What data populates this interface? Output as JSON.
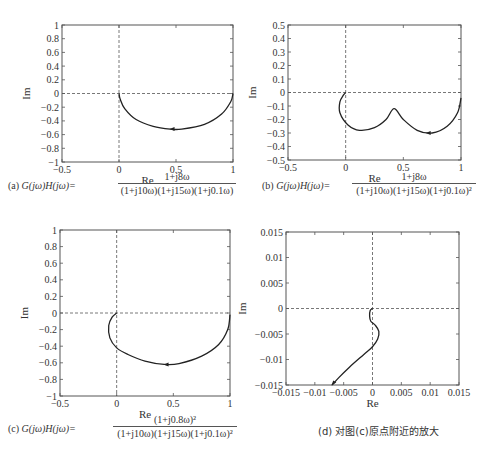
{
  "chart_data": [
    {
      "type": "line",
      "id": "a",
      "title": "",
      "xlabel": "Re",
      "ylabel": "Im",
      "xlim": [
        -0.5,
        1
      ],
      "ylim": [
        -1,
        1
      ],
      "xticks": [
        "-0.5",
        "0",
        "0.5",
        "1"
      ],
      "yticks": [
        "1",
        "0.8",
        "0.6",
        "0.4",
        "0.2",
        "0",
        "-0.2",
        "-0.4",
        "-0.6",
        "-0.8",
        "-1"
      ],
      "grid": false,
      "axes_dashed_lines": [
        "x=0",
        "y=0"
      ],
      "series": [
        {
          "name": "Nyquist (a)",
          "x": [
            1.0,
            0.98,
            0.9,
            0.75,
            0.55,
            0.45,
            0.3,
            0.15,
            0.05,
            0.01,
            0.0
          ],
          "y": [
            0.0,
            -0.12,
            -0.3,
            -0.45,
            -0.52,
            -0.52,
            -0.48,
            -0.38,
            -0.22,
            -0.08,
            0.0
          ]
        }
      ],
      "annotations": [
        "arrow at (0.47,-0.52) pointing left"
      ],
      "caption_prefix": "(a)",
      "caption_lhs": "G(jω)H(jω)=",
      "caption_num": "1+j8ω",
      "caption_den": "(1+j10ω)(1+j15ω)(1+j0.1ω)"
    },
    {
      "type": "line",
      "id": "b",
      "xlabel": "Re",
      "ylabel": "Im",
      "xlim": [
        -0.5,
        1
      ],
      "ylim": [
        -0.5,
        0.5
      ],
      "xticks": [
        "-0.5",
        "0",
        "0.5",
        "1"
      ],
      "yticks": [
        "0.5",
        "0.4",
        "0.3",
        "0.2",
        "0.1",
        "0",
        "-0.1",
        "-0.2",
        "-0.3",
        "-0.4",
        "-0.5"
      ],
      "grid": false,
      "series": [
        {
          "name": "Nyquist (b)",
          "x": [
            1.0,
            0.97,
            0.88,
            0.75,
            0.62,
            0.5,
            0.42,
            0.35,
            0.25,
            0.12,
            0.02,
            -0.05,
            -0.05,
            -0.02,
            0.0
          ],
          "y": [
            -0.04,
            -0.15,
            -0.25,
            -0.3,
            -0.28,
            -0.2,
            -0.12,
            -0.2,
            -0.26,
            -0.28,
            -0.24,
            -0.15,
            -0.07,
            -0.02,
            0.0
          ]
        }
      ],
      "annotations": [
        "arrow at (0.72,-0.3) pointing left",
        "cusp near (0.41,-0.12)"
      ],
      "caption_prefix": "(b)",
      "caption_lhs": "G(jω)H(jω)=",
      "caption_num": "1+j8ω",
      "caption_den": "(1+j10ω)(1+j15ω)(1+j0.1ω)²"
    },
    {
      "type": "line",
      "id": "c",
      "xlabel": "Re",
      "ylabel": "Im",
      "xlim": [
        -0.5,
        1
      ],
      "ylim": [
        -1,
        1
      ],
      "xticks": [
        "-0.5",
        "0",
        "0.5",
        "1"
      ],
      "yticks": [
        "1",
        "0.8",
        "0.6",
        "0.4",
        "0.2",
        "0",
        "-0.2",
        "-0.4",
        "-0.6",
        "-0.8",
        "-1"
      ],
      "grid": false,
      "series": [
        {
          "name": "Nyquist (c)",
          "x": [
            1.0,
            0.98,
            0.9,
            0.75,
            0.55,
            0.42,
            0.25,
            0.1,
            0.0,
            -0.06,
            -0.07,
            -0.04,
            0.0
          ],
          "y": [
            -0.02,
            -0.2,
            -0.38,
            -0.52,
            -0.61,
            -0.62,
            -0.58,
            -0.5,
            -0.42,
            -0.3,
            -0.15,
            -0.05,
            0.0
          ]
        }
      ],
      "annotations": [
        "arrow at (0.44,-0.62) pointing left"
      ],
      "caption_prefix": "(c)",
      "caption_lhs": "G(jω)H(jω)=",
      "caption_num": "(1+j0.8ω)²",
      "caption_den": "(1+j10ω)(1+j15ω)(1+j0.1ω)²"
    },
    {
      "type": "line",
      "id": "d",
      "xlabel": "Re",
      "ylabel": "Im",
      "xlim": [
        -0.015,
        0.015
      ],
      "ylim": [
        -0.015,
        0.015
      ],
      "xticks": [
        "-0.015",
        "-0.01",
        "-0.005",
        "0",
        "0.005",
        "0.01",
        "0.015"
      ],
      "yticks": [
        "0.015",
        "0.01",
        "0.005",
        "0",
        "-0.005",
        "-0.01",
        "-0.015"
      ],
      "grid": false,
      "series": [
        {
          "name": "Nyquist (c) zoom",
          "x": [
            0.0,
            -0.0004,
            -0.0005,
            -0.0003,
            0.0005,
            0.0011,
            0.0009,
            0.0,
            -0.0015,
            -0.004,
            -0.0058,
            -0.007
          ],
          "y": [
            0.0,
            -0.0004,
            -0.0015,
            -0.0025,
            -0.0033,
            -0.0045,
            -0.006,
            -0.0075,
            -0.009,
            -0.0115,
            -0.0135,
            -0.015
          ]
        }
      ],
      "caption": "(d) 对图(c)原点附近的放大"
    }
  ]
}
